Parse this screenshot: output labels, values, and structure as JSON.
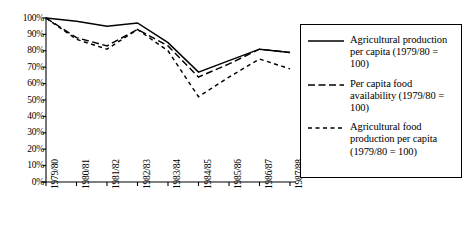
{
  "chart_data": {
    "type": "line",
    "title": "",
    "xlabel": "",
    "ylabel": "",
    "ylim": [
      0,
      100
    ],
    "y_tick_labels": [
      "100%",
      "90%",
      "80%",
      "70%",
      "60%",
      "50%",
      "40%",
      "30%",
      "20%",
      "10%",
      "0%"
    ],
    "y_ticks": [
      100,
      90,
      80,
      70,
      60,
      50,
      40,
      30,
      20,
      10,
      0
    ],
    "grid": false,
    "legend_position": "right",
    "categories": [
      "1979/80",
      "1980/81",
      "1981/82",
      "1982/83",
      "1983/84",
      "1984/85",
      "1985/86",
      "1986/87",
      "1987/88"
    ],
    "series": [
      {
        "name": "Agricultural production per capita (1979/80 = 100)",
        "style": "solid",
        "values": [
          100,
          98,
          95,
          97,
          85,
          67,
          74,
          81,
          79
        ]
      },
      {
        "name": "Per capita food availability (1979/80 = 100)",
        "style": "long-dash",
        "values": [
          100,
          88,
          83,
          93,
          83,
          64,
          72,
          81,
          79
        ]
      },
      {
        "name": "Agricultural food production per capita (1979/80 = 100)",
        "style": "short-dash",
        "values": [
          100,
          87,
          81,
          93,
          80,
          52,
          64,
          75,
          69
        ]
      }
    ]
  },
  "legend": {
    "entries": [
      {
        "label": "Agricultural production per capita (1979/80 = 100)",
        "style": "solid"
      },
      {
        "label": "Per capita food availability (1979/80 = 100)",
        "style": "long-dash"
      },
      {
        "label": "Agricultural food production per capita (1979/80 = 100)",
        "style": "short-dash"
      }
    ]
  },
  "colors": {
    "line": "#000000",
    "axis": "#000000",
    "background": "#ffffff"
  }
}
